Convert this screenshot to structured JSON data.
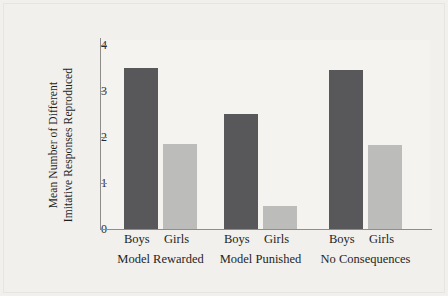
{
  "chart_data": {
    "type": "bar",
    "title": "",
    "subtitle": "",
    "xlabel": "",
    "ylabel": "Mean Number of Different Imitative Responses Reproduced",
    "ylabel_line1": "Mean Number of Different",
    "ylabel_line2": "Imitative Responses Reproduced",
    "ylim": [
      0,
      4
    ],
    "ytick_labels": [
      "0",
      "1",
      "2",
      "3",
      "4"
    ],
    "ytick_values": [
      0,
      1,
      2,
      3,
      4
    ],
    "grid": false,
    "legend": "none",
    "categories": [
      "Model Rewarded",
      "Model Punished",
      "No Consequences"
    ],
    "subcategories": [
      "Boys",
      "Girls"
    ],
    "series": [
      {
        "name": "Boys",
        "color": "#58585a",
        "values": [
          3.5,
          2.5,
          3.45
        ]
      },
      {
        "name": "Girls",
        "color": "#bcbcba",
        "values": [
          1.85,
          0.5,
          1.83
        ]
      }
    ],
    "bars": [
      {
        "group": "Model Rewarded",
        "sub": "Boys",
        "value": 3.5,
        "series": "Boys"
      },
      {
        "group": "Model Rewarded",
        "sub": "Girls",
        "value": 1.85,
        "series": "Girls"
      },
      {
        "group": "Model Punished",
        "sub": "Boys",
        "value": 2.5,
        "series": "Boys"
      },
      {
        "group": "Model Punished",
        "sub": "Girls",
        "value": 0.5,
        "series": "Girls"
      },
      {
        "group": "No Consequences",
        "sub": "Boys",
        "value": 3.45,
        "series": "Boys"
      },
      {
        "group": "No Consequences",
        "sub": "Girls",
        "value": 1.83,
        "series": "Girls"
      }
    ]
  },
  "axis": {
    "ticks": [
      {
        "label": "4",
        "value": 4
      },
      {
        "label": "3",
        "value": 3
      },
      {
        "label": "2",
        "value": 2
      },
      {
        "label": "1",
        "value": 1
      },
      {
        "label": "0",
        "value": 0
      }
    ]
  },
  "groups": [
    {
      "label": "Model Rewarded",
      "boys": "Boys",
      "girls": "Girls"
    },
    {
      "label": "Model Punished",
      "boys": "Boys",
      "girls": "Girls"
    },
    {
      "label": "No Consequences",
      "boys": "Boys",
      "girls": "Girls"
    }
  ],
  "colors": {
    "boys_bar": "#58585a",
    "girls_bar": "#bcbcba",
    "background": "#f1f0ed",
    "plot_background": "#f4f3f0",
    "axis": "#8e8d8a",
    "text": "#1f1f1f"
  }
}
